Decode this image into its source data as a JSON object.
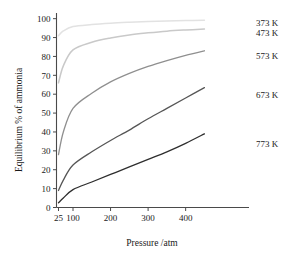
{
  "chart_data": {
    "type": "line",
    "title": "",
    "xlabel": "Pressure /atm",
    "ylabel": "Equilibrium % of ammonia",
    "xticks": [
      25,
      100,
      200,
      300,
      400
    ],
    "xtick_labels": [
      "25",
      "100",
      "200",
      "300",
      "400"
    ],
    "yticks": [
      0,
      10,
      20,
      30,
      40,
      50,
      60,
      70,
      80,
      90,
      100
    ],
    "ytick_labels": [
      "0",
      "10",
      "20",
      "30",
      "40",
      "50",
      "60",
      "70",
      "80",
      "90",
      "100"
    ],
    "xlim": [
      25,
      475
    ],
    "ylim": [
      0,
      103
    ],
    "grid": false,
    "legend_position": "right-inline-labels",
    "x": [
      25,
      50,
      100,
      150,
      200,
      250,
      300,
      350,
      400,
      450
    ],
    "series": [
      {
        "name": "373 K",
        "label": "373 K",
        "color": "#e2e2e2",
        "values": [
          91.0,
          93.5,
          95.8,
          96.9,
          97.6,
          98.1,
          98.5,
          98.8,
          99.0,
          99.2
        ]
      },
      {
        "name": "473 K",
        "label": "473 K",
        "color": "#c9c9c9",
        "values": [
          66.0,
          75.0,
          83.5,
          87.5,
          89.8,
          91.4,
          92.5,
          93.4,
          94.0,
          94.5
        ]
      },
      {
        "name": "573 K",
        "label": "573 K",
        "color": "#8f8f8f",
        "values": [
          28.0,
          40.0,
          52.5,
          60.5,
          66.5,
          71.0,
          74.7,
          77.8,
          80.6,
          83.0
        ]
      },
      {
        "name": "673 K",
        "label": "673 K",
        "color": "#565656",
        "values": [
          9.0,
          14.5,
          22.5,
          29.5,
          35.5,
          41.0,
          47.0,
          52.5,
          58.0,
          63.5
        ]
      },
      {
        "name": "773 K",
        "label": "773 K",
        "color": "#2e2e2e",
        "values": [
          2.5,
          5.0,
          9.5,
          13.5,
          17.5,
          21.5,
          25.5,
          29.5,
          34.0,
          39.0
        ]
      }
    ]
  }
}
